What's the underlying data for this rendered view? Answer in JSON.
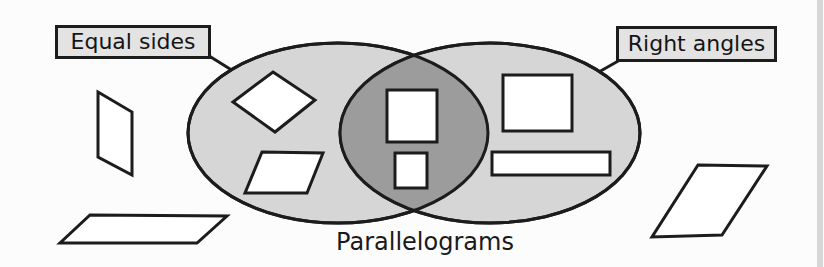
{
  "diagram": {
    "type": "venn-diagram",
    "caption": "Parallelograms",
    "sets": [
      {
        "label": "Equal sides",
        "side": "left"
      },
      {
        "label": "Right angles",
        "side": "right"
      }
    ],
    "regions": {
      "equal_sides_only_shapes": [
        "tilted rhombus",
        "parallelogram"
      ],
      "intersection_shapes": [
        "large square",
        "small square"
      ],
      "right_angles_only_shapes": [
        "near-square rectangle",
        "long rectangle"
      ],
      "outside_shapes": [
        "narrow slanted parallelogram (left)",
        "wide flat parallelogram (bottom left)",
        "slanted parallelogram (bottom right)"
      ]
    }
  },
  "colors": {
    "set_fill": "#d6d6d6",
    "intersection_fill": "#9c9c9c",
    "outline": "#1c1c1c",
    "label_box_fill": "#e3e3e3",
    "shape_fill": "#ffffff",
    "page_edge_band": "#d6d8d8"
  }
}
